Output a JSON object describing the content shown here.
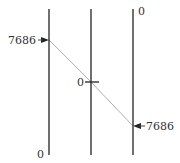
{
  "chart_data": {
    "type": "parallel_coordinates",
    "title": "",
    "axes": [
      {
        "name": "axis-1",
        "x": 49,
        "top_label": "",
        "bottom_label": "0",
        "marker_value": "7686",
        "marker_y": 40,
        "marker_side": "left",
        "tick": false
      },
      {
        "name": "axis-2",
        "x": 91,
        "top_label": "",
        "bottom_label": "",
        "marker_value": "0",
        "marker_y": 82,
        "marker_side": "left",
        "tick": true
      },
      {
        "name": "axis-3",
        "x": 133,
        "top_label": "0",
        "bottom_label": "",
        "marker_value": "7686",
        "marker_y": 126,
        "marker_side": "right",
        "tick": false
      }
    ],
    "series": [
      {
        "name": "record-1",
        "values": [
          7686,
          0,
          7686
        ],
        "color": "#aaaaaa"
      }
    ],
    "axis_range": {
      "top": 9,
      "bottom": 155
    },
    "colors": {
      "axis": "#222222",
      "line": "#b0b0b0",
      "label": "#333333"
    }
  },
  "labels": {
    "axis1_marker": "7686",
    "axis1_bottom": "0",
    "axis2_marker": "0",
    "axis3_top": "0",
    "axis3_marker": "7686"
  }
}
